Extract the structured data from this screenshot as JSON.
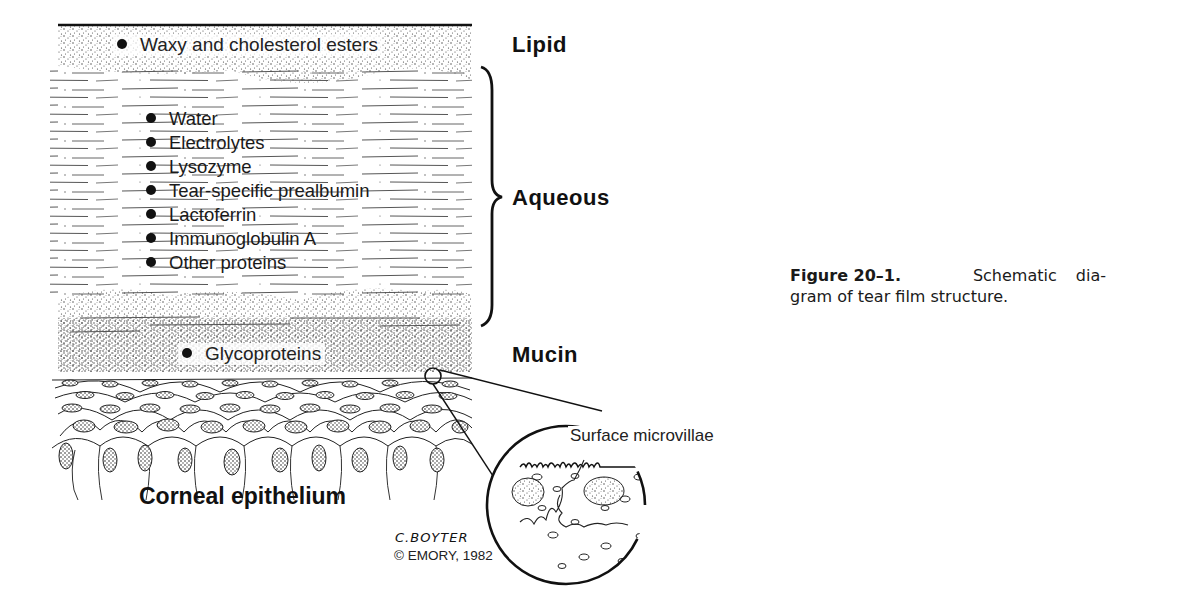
{
  "figure": {
    "caption_label": "Figure 20–1.",
    "caption_text": "Schematic diagram of tear film structure.",
    "caption_line1_rest": "Schematic dia-",
    "caption_line2": "gram of tear film structure."
  },
  "layers": {
    "lipid": {
      "label": "Lipid",
      "components": [
        "Waxy and cholesterol esters"
      ]
    },
    "aqueous": {
      "label": "Aqueous",
      "components": [
        "Water",
        "Electrolytes",
        "Lysozyme",
        "Tear-specific prealbumin",
        "Lactoferrin",
        "Immunoglobulin A",
        "Other proteins"
      ]
    },
    "mucin": {
      "label": "Mucin",
      "components": [
        "Glycoproteins"
      ]
    }
  },
  "tissue": {
    "label": "Corneal epithelium",
    "inset_label": "Surface microvillae"
  },
  "credit": {
    "signature": "C.BOYTER",
    "copyright": "© EMORY, 1982"
  },
  "colors": {
    "ink": "#111111",
    "background": "#ffffff"
  }
}
